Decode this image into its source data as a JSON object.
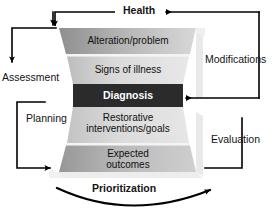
{
  "diagram": {
    "title_top": "Health",
    "colors": {
      "band_dark_gray": "#9a9a9a",
      "band_light_gray": "#d2d2d2",
      "band_mid_gray": "#bdbdbd",
      "diagnosis_fill": "#2b2b2b",
      "diagnosis_text": "#ffffff",
      "shadow_gray": "#e2e2e2",
      "line_black": "#000000",
      "background": "#ffffff"
    },
    "funnel_bands": [
      {
        "id": "alteration",
        "label": "Alteration/problem",
        "lines": [
          "Alteration/problem"
        ],
        "emphasis": "normal"
      },
      {
        "id": "signs",
        "label": "Signs of illness",
        "lines": [
          "Signs of illness"
        ],
        "emphasis": "normal"
      },
      {
        "id": "diagnosis",
        "label": "Diagnosis",
        "lines": [
          "Diagnosis"
        ],
        "emphasis": "highlight"
      },
      {
        "id": "restorative",
        "label": "Restorative interventions/goals",
        "lines": [
          "Restorative",
          "interventions/goals"
        ],
        "emphasis": "normal"
      },
      {
        "id": "expected",
        "label": "Expected outcomes",
        "lines": [
          "Expected",
          "outcomes"
        ],
        "emphasis": "normal"
      }
    ],
    "process_labels": {
      "health": "Health",
      "assessment": "Assessment",
      "planning": "Planning",
      "modifications": "Modifications",
      "evaluation": "Evaluation",
      "prioritization": "Prioritization"
    },
    "connectors": [
      {
        "id": "health-return",
        "from": "Modifications loop",
        "to": "Health",
        "arrow_direction": "left"
      },
      {
        "id": "health-to-assessment",
        "from": "Health",
        "to": "Alteration/problem",
        "arrow_direction": "down"
      },
      {
        "id": "assessment-loop",
        "from": "Alteration/problem",
        "to": "Assessment",
        "arrow_direction": "down"
      },
      {
        "id": "planning-loop",
        "from": "Planning",
        "to": "Restorative interventions/goals",
        "arrow_direction": "right"
      },
      {
        "id": "modifications-loop",
        "from": "Modifications",
        "to": "Diagnosis",
        "arrow_direction": "left"
      },
      {
        "id": "evaluation-loop",
        "from": "Expected outcomes",
        "to": "Evaluation",
        "arrow_direction": "up"
      },
      {
        "id": "prioritization-arc",
        "from": "bottom-left",
        "to": "bottom-right",
        "arrow_direction": "up-right"
      }
    ]
  }
}
